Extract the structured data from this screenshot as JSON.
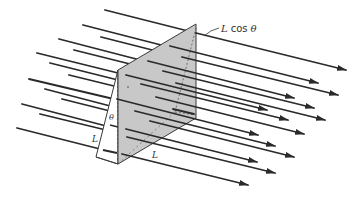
{
  "figure": {
    "colors": {
      "arrows": "#2a2a2a",
      "plane_fill": "#c8c8c8",
      "plane_edge": "#3a3a3a",
      "background": "#ffffff"
    }
  },
  "labels": {
    "lcos_L": "L",
    "lcos_rest": "cos",
    "lcos_theta": "θ",
    "theta": "θ",
    "side_left": "L",
    "side_bottom": "L"
  }
}
